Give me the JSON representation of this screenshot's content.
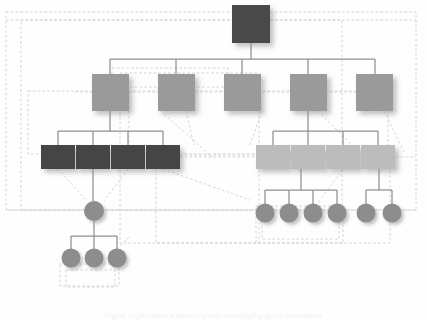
{
  "diagram": {
    "type": "tree-hierarchy",
    "background_color": "#fefefe",
    "caption_text": "Figure  organizational hierarchy with overlapping group boundaries",
    "palette": {
      "root_node": "#4a4a4a",
      "level2_node": "#9a9a9a",
      "level3_dark_node": "#454545",
      "level3_light_node": "#bcbcbc",
      "circle_node": "#8d8d8d",
      "connector_line": "#8f8f8f",
      "dashed_boundary": "#cfcfcf",
      "shadow": "rgba(140,140,140,0.45)"
    },
    "levels": [
      {
        "id": "L1",
        "label": "Root level",
        "shape": "square",
        "count": 1,
        "fill": "#4a4a4a"
      },
      {
        "id": "L2",
        "label": "Second level",
        "shape": "square",
        "count": 5,
        "fill": "#9a9a9a"
      },
      {
        "id": "L3",
        "label": "Third level",
        "shape": "rectangle",
        "count": 8,
        "fill": "#454545 / #bcbcbc"
      },
      {
        "id": "L4",
        "label": "Fourth level",
        "shape": "circle",
        "count": 7,
        "fill": "#8d8d8d"
      },
      {
        "id": "L5",
        "label": "Fifth level",
        "shape": "circle",
        "count": 3,
        "fill": "#8d8d8d"
      }
    ],
    "nodes": {
      "root": {
        "name": "root-node",
        "x": 232,
        "y": 5,
        "w": 38,
        "h": 38,
        "fill": "#4a4a4a"
      },
      "level2": [
        {
          "name": "level2-node-1",
          "x": 92,
          "y": 74,
          "w": 37,
          "h": 37,
          "fill": "#9a9a9a"
        },
        {
          "name": "level2-node-2",
          "x": 158,
          "y": 74,
          "w": 37,
          "h": 37,
          "fill": "#9a9a9a"
        },
        {
          "name": "level2-node-3",
          "x": 224,
          "y": 74,
          "w": 37,
          "h": 37,
          "fill": "#9a9a9a"
        },
        {
          "name": "level2-node-4",
          "x": 290,
          "y": 74,
          "w": 37,
          "h": 37,
          "fill": "#9a9a9a"
        },
        {
          "name": "level2-node-5",
          "x": 356,
          "y": 74,
          "w": 37,
          "h": 37,
          "fill": "#9a9a9a"
        }
      ],
      "level3_left": [
        {
          "name": "level3-dark-node-1",
          "x": 41,
          "y": 145,
          "w": 34,
          "h": 24,
          "fill": "#454545"
        },
        {
          "name": "level3-dark-node-2",
          "x": 76,
          "y": 145,
          "w": 34,
          "h": 24,
          "fill": "#454545"
        },
        {
          "name": "level3-dark-node-3",
          "x": 111,
          "y": 145,
          "w": 34,
          "h": 24,
          "fill": "#454545"
        },
        {
          "name": "level3-dark-node-4",
          "x": 146,
          "y": 145,
          "w": 34,
          "h": 24,
          "fill": "#454545"
        }
      ],
      "level3_right": [
        {
          "name": "level3-light-node-1",
          "x": 256,
          "y": 145,
          "w": 34,
          "h": 24,
          "fill": "#bcbcbc"
        },
        {
          "name": "level3-light-node-2",
          "x": 291,
          "y": 145,
          "w": 34,
          "h": 24,
          "fill": "#bcbcbc"
        },
        {
          "name": "level3-light-node-3",
          "x": 326,
          "y": 145,
          "w": 34,
          "h": 24,
          "fill": "#bcbcbc"
        },
        {
          "name": "level3-light-node-4",
          "x": 361,
          "y": 145,
          "w": 34,
          "h": 24,
          "fill": "#bcbcbc"
        }
      ],
      "level4_left": [
        {
          "name": "level4-circle-left-1",
          "cx": 94,
          "cy": 211,
          "r": 10,
          "fill": "#8d8d8d"
        }
      ],
      "level4_right": [
        {
          "name": "level4-circle-right-1",
          "cx": 265,
          "cy": 213,
          "r": 9.5,
          "fill": "#8d8d8d"
        },
        {
          "name": "level4-circle-right-2",
          "cx": 289,
          "cy": 213,
          "r": 9.5,
          "fill": "#8d8d8d"
        },
        {
          "name": "level4-circle-right-3",
          "cx": 313,
          "cy": 213,
          "r": 9.5,
          "fill": "#8d8d8d"
        },
        {
          "name": "level4-circle-right-4",
          "cx": 337,
          "cy": 213,
          "r": 9.5,
          "fill": "#8d8d8d"
        },
        {
          "name": "level4-circle-right-5",
          "cx": 366,
          "cy": 213,
          "r": 9.5,
          "fill": "#8d8d8d"
        },
        {
          "name": "level4-circle-right-6",
          "cx": 392,
          "cy": 213,
          "r": 9.5,
          "fill": "#8d8d8d"
        }
      ],
      "level5_left": [
        {
          "name": "level5-circle-1",
          "cx": 71,
          "cy": 258,
          "r": 9.5,
          "fill": "#8d8d8d"
        },
        {
          "name": "level5-circle-2",
          "cx": 94,
          "cy": 258,
          "r": 9.5,
          "fill": "#8d8d8d"
        },
        {
          "name": "level5-circle-3",
          "cx": 117,
          "cy": 258,
          "r": 9.5,
          "fill": "#8d8d8d"
        }
      ]
    },
    "solid_connectors": [
      {
        "name": "connector-root-down",
        "points": "251,43 251,59"
      },
      {
        "name": "connector-level2-bus",
        "points": "110,59 375,59"
      },
      {
        "name": "connector-level2-stub-1",
        "points": "110,59 110,74"
      },
      {
        "name": "connector-level2-stub-2",
        "points": "176,59 176,74"
      },
      {
        "name": "connector-level2-stub-3",
        "points": "242,59 242,74"
      },
      {
        "name": "connector-level2-stub-4",
        "points": "308,59 308,74"
      },
      {
        "name": "connector-level2-stub-5",
        "points": "375,59 375,74"
      },
      {
        "name": "connector-n1-down",
        "points": "110,111 110,131"
      },
      {
        "name": "connector-left-bus",
        "points": "58,131 163,131"
      },
      {
        "name": "connector-left-stub-1",
        "points": "58,131 58,145"
      },
      {
        "name": "connector-left-stub-2",
        "points": "93,131 93,145"
      },
      {
        "name": "connector-left-stub-3",
        "points": "128,131 128,145"
      },
      {
        "name": "connector-left-stub-4",
        "points": "163,131 163,145"
      },
      {
        "name": "connector-n4-down",
        "points": "308,111 308,131"
      },
      {
        "name": "connector-right-bus",
        "points": "273,131 378,131"
      },
      {
        "name": "connector-right-stub-1",
        "points": "273,131 273,145"
      },
      {
        "name": "connector-right-stub-2",
        "points": "308,131 308,145"
      },
      {
        "name": "connector-right-stub-3",
        "points": "343,131 343,145"
      },
      {
        "name": "connector-right-stub-4",
        "points": "378,131 378,145"
      },
      {
        "name": "connector-dark2-to-circle",
        "points": "93,169 93,201"
      },
      {
        "name": "connector-circle-down",
        "points": "94,221 94,236"
      },
      {
        "name": "connector-l5-bus",
        "points": "71,236 117,236"
      },
      {
        "name": "connector-l5-stub-1",
        "points": "71,236 71,249"
      },
      {
        "name": "connector-l5-stub-2",
        "points": "94,236 94,249"
      },
      {
        "name": "connector-l5-stub-3",
        "points": "117,236 117,249"
      },
      {
        "name": "connector-light2-down",
        "points": "301,169 301,190"
      },
      {
        "name": "connector-r4-bus",
        "points": "265,190 337,190"
      },
      {
        "name": "connector-r4-stub-1",
        "points": "265,190 265,204"
      },
      {
        "name": "connector-r4-stub-2",
        "points": "289,190 289,204"
      },
      {
        "name": "connector-r4-stub-3",
        "points": "313,190 313,204"
      },
      {
        "name": "connector-r4-stub-4",
        "points": "337,190 337,204"
      },
      {
        "name": "connector-light4-down",
        "points": "379,169 379,190"
      },
      {
        "name": "connector-r2-bus",
        "points": "366,190 392,190"
      },
      {
        "name": "connector-r2-stub-1",
        "points": "366,190 366,204"
      },
      {
        "name": "connector-r2-stub-2",
        "points": "392,190 392,204"
      }
    ],
    "dashed_boundaries": [
      {
        "name": "boundary-outer-1",
        "x": 6,
        "y": 12,
        "w": 410,
        "h": 198
      },
      {
        "name": "boundary-outer-2",
        "x": 21,
        "y": 20,
        "w": 321,
        "h": 190
      },
      {
        "name": "boundary-inner-1",
        "x": 112,
        "y": 68,
        "w": 116,
        "h": 19
      },
      {
        "name": "boundary-inner-2",
        "x": 120,
        "y": 73,
        "w": 139,
        "h": 170
      },
      {
        "name": "boundary-inner-3",
        "x": 28,
        "y": 91,
        "w": 360,
        "h": 63
      },
      {
        "name": "boundary-inner-4",
        "x": 156,
        "y": 155,
        "w": 234,
        "h": 88
      },
      {
        "name": "boundary-inner-5",
        "x": 256,
        "y": 206,
        "w": 87,
        "h": 37
      },
      {
        "name": "boundary-inner-6",
        "x": 262,
        "y": 212,
        "w": 77,
        "h": 27
      },
      {
        "name": "boundary-inner-7",
        "x": 60,
        "y": 264,
        "w": 59,
        "h": 22
      },
      {
        "name": "boundary-inner-8",
        "x": 66,
        "y": 270,
        "w": 49,
        "h": 17
      }
    ],
    "dashed_links": [
      {
        "name": "dashlink-1",
        "points": "6,20 416,20"
      },
      {
        "name": "dashlink-2",
        "points": "75,92 385,92"
      },
      {
        "name": "dashlink-3",
        "points": "129,92 129,157"
      },
      {
        "name": "dashlink-4",
        "points": "161,111 212,157"
      },
      {
        "name": "dashlink-5",
        "points": "186,111 194,145"
      },
      {
        "name": "dashlink-6",
        "points": "262,111 250,145"
      },
      {
        "name": "dashlink-7",
        "points": "318,111 352,145"
      },
      {
        "name": "dashlink-8",
        "points": "384,111 404,152"
      },
      {
        "name": "dashlink-9",
        "points": "58,169 87,201"
      },
      {
        "name": "dashlink-10",
        "points": "128,169 104,201"
      },
      {
        "name": "dashlink-11",
        "points": "163,169 250,200"
      },
      {
        "name": "dashlink-12",
        "points": "343,169 318,203"
      },
      {
        "name": "dashlink-13",
        "points": "180,157 416,157"
      },
      {
        "name": "dashlink-14",
        "points": "6,210 416,210"
      },
      {
        "name": "dashlink-15",
        "points": "117,249 130,236"
      }
    ]
  }
}
